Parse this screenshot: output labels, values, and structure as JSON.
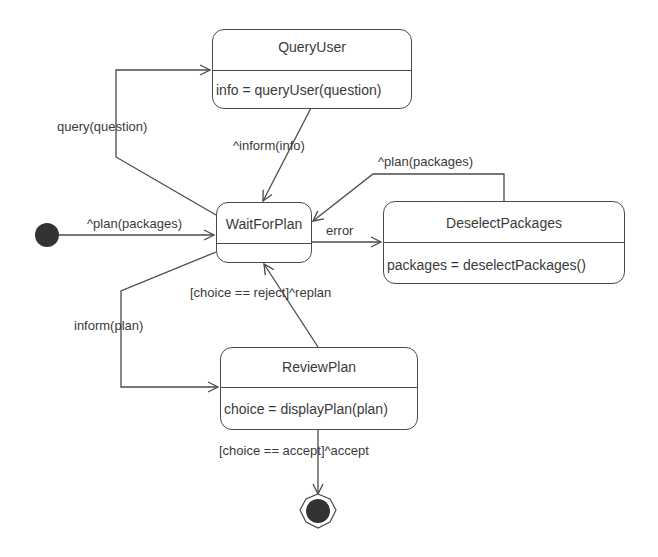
{
  "diagram": {
    "type": "UML state machine",
    "colors": {
      "line": "#4a4a4a",
      "text": "#3a3a3a",
      "pseudostate": "#333333",
      "background": "#ffffff"
    },
    "states": [
      {
        "id": "query_user",
        "name": "QueryUser",
        "action": "info = queryUser(question)"
      },
      {
        "id": "wait_for_plan",
        "name": "WaitForPlan",
        "action": ""
      },
      {
        "id": "deselect_packages",
        "name": "DeselectPackages",
        "action": "packages = deselectPackages()"
      },
      {
        "id": "review_plan",
        "name": "ReviewPlan",
        "action": "choice = displayPlan(plan)"
      }
    ],
    "pseudostates": {
      "initial": "initial-state",
      "final": "final-state"
    },
    "transitions": [
      {
        "from": "initial",
        "to": "WaitForPlan",
        "label": "^plan(packages)"
      },
      {
        "from": "WaitForPlan",
        "to": "QueryUser",
        "label": "query(question)"
      },
      {
        "from": "QueryUser",
        "to": "WaitForPlan",
        "label": "^inform(info)"
      },
      {
        "from": "WaitForPlan",
        "to": "DeselectPackages",
        "label": "error"
      },
      {
        "from": "DeselectPackages",
        "to": "WaitForPlan",
        "label": "^plan(packages)"
      },
      {
        "from": "WaitForPlan",
        "to": "ReviewPlan",
        "label": "inform(plan)"
      },
      {
        "from": "ReviewPlan",
        "to": "WaitForPlan",
        "label": "[choice == reject]^replan"
      },
      {
        "from": "ReviewPlan",
        "to": "final",
        "label": "[choice == accept]^accept"
      }
    ]
  }
}
